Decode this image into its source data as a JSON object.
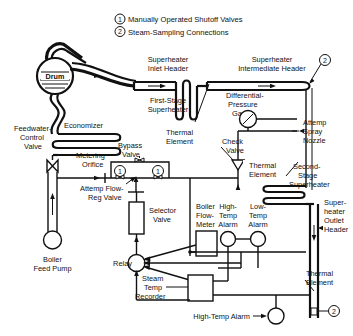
{
  "diagram": {
    "type": "process-instrumentation-diagram"
  },
  "legend": [
    {
      "marker": "1",
      "text": "Manually Operated Shutoff Valves"
    },
    {
      "marker": "2",
      "text": "Steam-Sampling Connections"
    }
  ],
  "labels": {
    "drum": "Drum",
    "economizer": "Economizer",
    "feedwater_control_valve": "Feedwater-\nControl\nValve",
    "feedwater_control_valve_l1": "Feedwater-",
    "feedwater_control_valve_l2": "Control",
    "feedwater_control_valve_l3": "Valve",
    "boiler_feed_pump_l1": "Boiler",
    "boiler_feed_pump_l2": "Feed Pump",
    "superheater_inlet_header_l1": "Superheater",
    "superheater_inlet_header_l2": "Inlet Header",
    "first_stage_superheater_l1": "First-Stage",
    "first_stage_superheater_l2": "Superheater",
    "superheater_intermediate_header_l1": "Superheater",
    "superheater_intermediate_header_l2": "Intermediate Header",
    "differential_pressure_gage_l1": "Differential-",
    "differential_pressure_gage_l2": "Pressure",
    "differential_pressure_gage_l3": "Gage",
    "thermal_element_1_l1": "Thermal",
    "thermal_element_1_l2": "Element",
    "thermal_element_2_l1": "Thermal",
    "thermal_element_2_l2": "Element",
    "thermal_element_3_l1": "Thermal",
    "thermal_element_3_l2": "Element",
    "check_valve_l1": "Check",
    "check_valve_l2": "Valve",
    "attemp_spray_nozzle_l1": "Attemp",
    "attemp_spray_nozzle_l2": "Spray",
    "attemp_spray_nozzle_l3": "Nozzle",
    "second_stage_superheater_l1": "Second-",
    "second_stage_superheater_l2": "Stage",
    "second_stage_superheater_l3": "Superheater",
    "superheater_outlet_header_l1": "Super-",
    "superheater_outlet_header_l2": "heater",
    "superheater_outlet_header_l3": "Outlet",
    "superheater_outlet_header_l4": "Header",
    "metering_orifice_l1": "Metering",
    "metering_orifice_l2": "Orifice",
    "bypass_valve_l1": "Bypass",
    "bypass_valve_l2": "Valve",
    "attemp_flow_reg_valve_l1": "Attemp Flow-",
    "attemp_flow_reg_valve_l2": "Reg Valve",
    "selector_valve_l1": "Selector",
    "selector_valve_l2": "Valve",
    "boiler_flow_meter_l1": "Boiler",
    "boiler_flow_meter_l2": "Flow-",
    "boiler_flow_meter_l3": "Meter",
    "high_temp_alarm_l1": "High-",
    "high_temp_alarm_l2": "Temp",
    "high_temp_alarm_l3": "Alarm",
    "low_temp_alarm_l1": "Low-",
    "low_temp_alarm_l2": "Temp",
    "low_temp_alarm_l3": "Alarm",
    "relay": "Relay",
    "steam_temp_recorder_l1": "Steam",
    "steam_temp_recorder_l2": "Temp",
    "steam_temp_recorder_l3": "Recorder",
    "high_temp_alarm_bottom": "High-Temp Alarm"
  },
  "markers": {
    "valve_1_a": "1",
    "valve_1_b": "1",
    "sample_2_top": "2",
    "sample_2_bottom": "2",
    "legend_1": "1",
    "legend_2": "2"
  },
  "colors": {
    "line": "#111111",
    "background": "#ffffff"
  }
}
